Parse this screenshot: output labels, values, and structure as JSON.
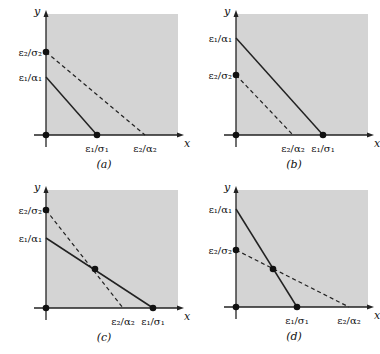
{
  "panels": [
    {
      "id": "a",
      "caption": "(a)",
      "origin": [
        46,
        135
      ],
      "region": [
        46,
        14,
        178,
        135
      ],
      "x_label": "x",
      "y_label": "y",
      "solid": {
        "y_intercept": 77,
        "x_intercept": 97
      },
      "dashed": {
        "y_intercept": 52,
        "x_intercept": 145
      },
      "dots": [
        [
          46,
          135
        ],
        [
          46,
          52
        ],
        [
          97,
          135
        ]
      ],
      "y_ticks": [
        {
          "label": "ε₂/σ₂",
          "y": 52
        },
        {
          "label": "ε₁/α₁",
          "y": 77
        }
      ],
      "x_ticks": [
        {
          "label": "ε₁/σ₁",
          "x": 97
        },
        {
          "label": "ε₂/α₂",
          "x": 145
        }
      ]
    },
    {
      "id": "b",
      "caption": "(b)",
      "origin": [
        236,
        135
      ],
      "region": [
        236,
        14,
        368,
        135
      ],
      "x_label": "x",
      "y_label": "y",
      "solid": {
        "y_intercept": 38,
        "x_intercept": 323
      },
      "dashed": {
        "y_intercept": 75,
        "x_intercept": 293
      },
      "dots": [
        [
          236,
          135
        ],
        [
          236,
          75
        ],
        [
          323,
          135
        ]
      ],
      "y_ticks": [
        {
          "label": "ε₁/α₁",
          "y": 38
        },
        {
          "label": "ε₂/σ₂",
          "y": 75
        }
      ],
      "x_ticks": [
        {
          "label": "ε₂/α₂",
          "x": 293
        },
        {
          "label": "ε₁/σ₁",
          "x": 323
        }
      ]
    },
    {
      "id": "c",
      "caption": "(c)",
      "origin": [
        46,
        308
      ],
      "region": [
        46,
        190,
        178,
        308
      ],
      "x_label": "x",
      "y_label": "y",
      "solid": {
        "y_intercept": 238,
        "x_intercept": 153
      },
      "dashed": {
        "y_intercept": 210,
        "x_intercept": 123
      },
      "dots": [
        [
          46,
          308
        ],
        [
          46,
          210
        ],
        [
          95,
          269
        ],
        [
          153,
          308
        ]
      ],
      "y_ticks": [
        {
          "label": "ε₂/σ₂",
          "y": 210
        },
        {
          "label": "ε₁/α₁",
          "y": 238
        }
      ],
      "x_ticks": [
        {
          "label": "ε₂/α₂",
          "x": 123
        },
        {
          "label": "ε₁/σ₁",
          "x": 153
        }
      ]
    },
    {
      "id": "d",
      "caption": "(d)",
      "origin": [
        236,
        307
      ],
      "region": [
        236,
        190,
        368,
        307
      ],
      "x_label": "x",
      "y_label": "y",
      "solid": {
        "y_intercept": 209,
        "x_intercept": 297
      },
      "dashed": {
        "y_intercept": 250,
        "x_intercept": 349
      },
      "dots": [
        [
          236,
          307
        ],
        [
          236,
          250
        ],
        [
          273,
          269
        ],
        [
          297,
          307
        ]
      ],
      "y_ticks": [
        {
          "label": "ε₁/α₁",
          "y": 209
        },
        {
          "label": "ε₂/σ₂",
          "y": 250
        }
      ],
      "x_ticks": [
        {
          "label": "ε₁/σ₁",
          "x": 297
        },
        {
          "label": "ε₂/α₂",
          "x": 349
        }
      ]
    }
  ],
  "colors": {
    "region": "#d4d4d4",
    "line": "#222222"
  }
}
